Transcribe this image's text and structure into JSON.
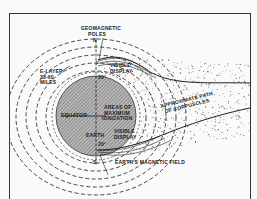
{
  "diagram": {
    "labels": {
      "geomagnetic_poles_line1": "GEOMAGNETIC",
      "geomagnetic_poles_line2": "POLES",
      "north": "N",
      "south": "S",
      "e_layer_line1": "E-LAYER",
      "e_layer_line2": "38-60",
      "e_layer_line3": "MILES",
      "visible_display_top_line1": "VISIBLE",
      "visible_display_top_line2": "DISPLAY",
      "lat_north": "20°",
      "lat_south": "20°",
      "equator": "EQUATOR",
      "areas_line1": "AREAS OF",
      "areas_line2": "MAXIMUM",
      "areas_line3": "IONIZATION",
      "earth": "EARTH",
      "visible_display_bottom_line1": "VISIBLE",
      "visible_display_bottom_line2": "DISPLAY",
      "path_line1": "APPROXIMATE PATH",
      "path_line2": "OF CORPUSCLES",
      "magnetic_field": "EARTH'S MAGNETIC FIELD"
    },
    "colors": {
      "ink": "#222222",
      "background": "#fafafa",
      "earth_hatch": "#888888"
    }
  }
}
